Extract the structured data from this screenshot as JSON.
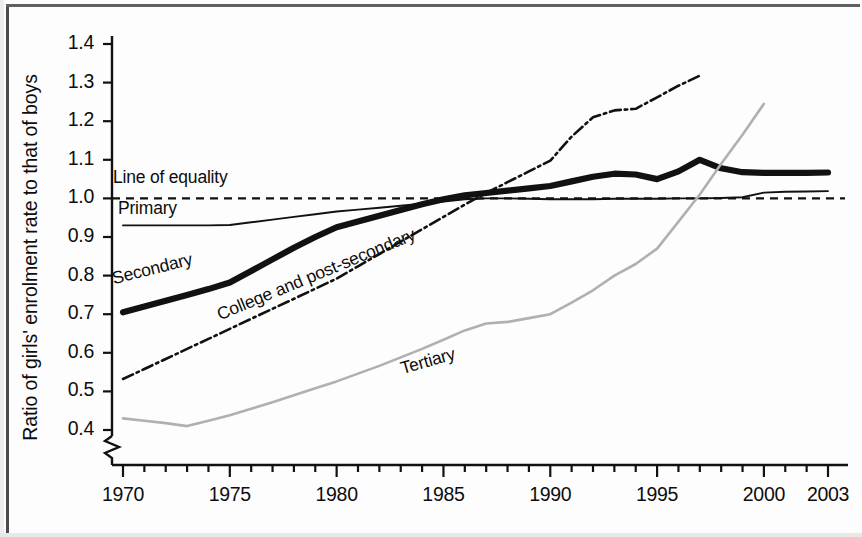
{
  "chart_data": {
    "type": "line",
    "title": "",
    "subtitle": "",
    "xlabel": "",
    "ylabel": "Ratio of girls' enrolment rate to that of boys",
    "xlim": [
      1970,
      2003
    ],
    "ylim": [
      0.37,
      1.42
    ],
    "y_axis_break": true,
    "y_axis_break_note": "axis broken below 0.4",
    "grid": false,
    "legend": "inline-labels",
    "x_ticks_labeled": [
      "1970",
      "1975",
      "1980",
      "1985",
      "1990",
      "1995",
      "2000",
      "2003"
    ],
    "x_ticks_labeled_values": [
      1970,
      1975,
      1980,
      1985,
      1990,
      1995,
      2000,
      2003
    ],
    "x_minor_tick_interval": 1,
    "y_ticks": [
      "0.4",
      "0.5",
      "0.6",
      "0.7",
      "0.8",
      "0.9",
      "1.0",
      "1.1",
      "1.2",
      "1.3",
      "1.4"
    ],
    "y_tick_values": [
      0.4,
      0.5,
      0.6,
      0.7,
      0.8,
      0.9,
      1.0,
      1.1,
      1.2,
      1.3,
      1.4
    ],
    "reference_line": {
      "label": "Line of equality",
      "value": 1.0,
      "style": "dashed",
      "color": "#111111"
    },
    "series": [
      {
        "name": "Primary",
        "label": "Primary",
        "style": "solid-thin",
        "color": "#111111",
        "x": [
          1970,
          1971,
          1972,
          1973,
          1974,
          1975,
          1976,
          1977,
          1978,
          1979,
          1980,
          1981,
          1982,
          1983,
          1984,
          1985,
          1986,
          1987,
          1988,
          1989,
          1990,
          1991,
          1992,
          1993,
          1994,
          1995,
          1996,
          1997,
          1998,
          1999,
          2000,
          2001,
          2002,
          2003
        ],
        "y": [
          0.93,
          0.93,
          0.93,
          0.93,
          0.93,
          0.931,
          0.938,
          0.945,
          0.952,
          0.959,
          0.966,
          0.971,
          0.976,
          0.981,
          0.986,
          0.992,
          0.998,
          1.0,
          1.0,
          0.999,
          0.998,
          0.998,
          0.998,
          0.999,
          0.999,
          0.999,
          1.0,
          1.0,
          1.001,
          1.003,
          1.015,
          1.017,
          1.018,
          1.019
        ]
      },
      {
        "name": "Secondary",
        "label": "Secondary",
        "style": "solid-thick",
        "color": "#111111",
        "x": [
          1970,
          1971,
          1972,
          1973,
          1974,
          1975,
          1976,
          1977,
          1978,
          1979,
          1980,
          1981,
          1982,
          1983,
          1984,
          1985,
          1986,
          1987,
          1988,
          1989,
          1990,
          1991,
          1992,
          1993,
          1994,
          1995,
          1996,
          1997,
          1998,
          1999,
          2000,
          2001,
          2002,
          2003
        ],
        "y": [
          0.705,
          0.72,
          0.735,
          0.75,
          0.765,
          0.782,
          0.812,
          0.842,
          0.872,
          0.9,
          0.925,
          0.94,
          0.955,
          0.97,
          0.985,
          0.998,
          1.008,
          1.014,
          1.02,
          1.026,
          1.032,
          1.044,
          1.056,
          1.064,
          1.062,
          1.05,
          1.07,
          1.1,
          1.078,
          1.068,
          1.066,
          1.066,
          1.066,
          1.067
        ]
      },
      {
        "name": "College and post-secondary",
        "label": "College and post-secondary",
        "style": "dash-dot",
        "color": "#111111",
        "x": [
          1970,
          1971,
          1972,
          1973,
          1974,
          1975,
          1976,
          1977,
          1978,
          1979,
          1980,
          1981,
          1982,
          1983,
          1984,
          1985,
          1986,
          1987,
          1988,
          1989,
          1990,
          1991,
          1992,
          1993,
          1994,
          1995,
          1996,
          1997
        ],
        "y": [
          0.532,
          0.558,
          0.584,
          0.61,
          0.636,
          0.662,
          0.688,
          0.714,
          0.74,
          0.766,
          0.792,
          0.824,
          0.856,
          0.888,
          0.92,
          0.952,
          0.984,
          1.014,
          1.042,
          1.07,
          1.098,
          1.16,
          1.21,
          1.228,
          1.232,
          1.262,
          1.292,
          1.318
        ]
      },
      {
        "name": "Tertiary",
        "label": "Tertiary",
        "style": "solid-thin-gray",
        "color": "#b0b0b0",
        "x": [
          1970,
          1971,
          1972,
          1973,
          1974,
          1975,
          1976,
          1977,
          1978,
          1979,
          1980,
          1981,
          1982,
          1983,
          1984,
          1985,
          1986,
          1987,
          1988,
          1989,
          1990,
          1991,
          1992,
          1993,
          1994,
          1995,
          1996,
          1997,
          1998,
          1999,
          2000
        ],
        "y": [
          0.43,
          0.424,
          0.418,
          0.41,
          0.424,
          0.438,
          0.455,
          0.472,
          0.49,
          0.508,
          0.526,
          0.546,
          0.566,
          0.588,
          0.61,
          0.634,
          0.658,
          0.676,
          0.68,
          0.69,
          0.7,
          0.73,
          0.762,
          0.8,
          0.83,
          0.87,
          0.94,
          1.01,
          1.09,
          1.165,
          1.245
        ]
      }
    ]
  },
  "axis": {
    "ylabel": "Ratio of girls' enrolment rate to that of boys",
    "ytick_labels": [
      "1.4",
      "1.3",
      "1.2",
      "1.1",
      "1.0",
      "0.9",
      "0.8",
      "0.7",
      "0.6",
      "0.5",
      "0.4"
    ],
    "xtick_labels": [
      "1970",
      "1975",
      "1980",
      "1985",
      "1990",
      "1995",
      "2000",
      "2003"
    ]
  },
  "annotations": {
    "line_of_equality": "Line of equality",
    "primary": "Primary",
    "secondary": "Secondary",
    "college": "College and post-secondary",
    "tertiary": "Tertiary"
  },
  "colors": {
    "ink": "#111111",
    "tertiary_gray": "#b0b0b0",
    "background": "#fdfdfd"
  }
}
